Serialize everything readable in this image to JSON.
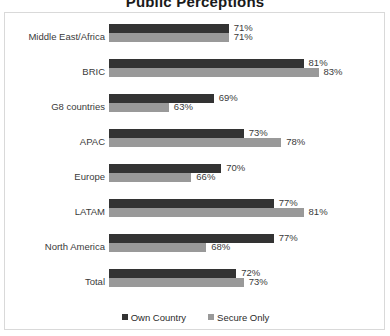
{
  "chart_data": {
    "type": "bar",
    "orientation": "horizontal",
    "title": "Public Perceptions",
    "xlabel": "",
    "ylabel": "",
    "grid": false,
    "legend_position": "bottom",
    "value_suffix": "%",
    "categories": [
      "Middle East/Africa",
      "BRIC",
      "G8 countries",
      "APAC",
      "Europe",
      "LATAM",
      "North America",
      "Total"
    ],
    "series": [
      {
        "name": "Own Country",
        "color": "#333333",
        "values": [
          71,
          81,
          69,
          73,
          70,
          77,
          77,
          72
        ],
        "labels": [
          "71%",
          "81%",
          "69%",
          "73%",
          "70%",
          "77%",
          "77%",
          "72%"
        ]
      },
      {
        "name": "Secure Only",
        "color": "#999999",
        "values": [
          71,
          83,
          63,
          78,
          66,
          81,
          68,
          73
        ],
        "labels": [
          "71%",
          "83%",
          "63%",
          "78%",
          "66%",
          "81%",
          "68%",
          "73%"
        ]
      }
    ],
    "axis_visible_min": 55,
    "axis_visible_max": 86
  }
}
